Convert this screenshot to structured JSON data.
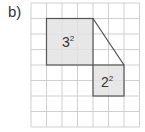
{
  "figure": {
    "part_label": "b)",
    "grid": {
      "columns": 7,
      "rows": 8,
      "cell_size": 15.5,
      "origin_x": 31,
      "origin_y": 3,
      "line_color": "#cfcfcf"
    },
    "squares": [
      {
        "label_base": "3",
        "label_exp": "2",
        "col": 1,
        "row": 1,
        "size": 3,
        "fill": "#e3e3e3",
        "stroke": "#555555"
      },
      {
        "label_base": "2",
        "label_exp": "2",
        "col": 4,
        "row": 4,
        "size": 2,
        "fill": "#e3e3e3",
        "stroke": "#555555"
      }
    ],
    "connector": {
      "from": "top-right of 3² square",
      "to": "top-right of 2² square"
    }
  }
}
